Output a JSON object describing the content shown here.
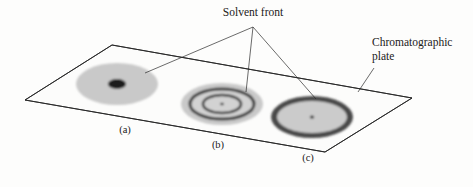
{
  "figure": {
    "background_color": "#fdfdfc"
  },
  "callouts": {
    "solvent_front": {
      "label": "Solvent front",
      "x": 253,
      "y": 18,
      "anchor_x": 253,
      "anchor_y": 27,
      "leader_targets": [
        {
          "name": "spot-a",
          "x": 145,
          "y": 73
        },
        {
          "name": "spot-b",
          "x": 246,
          "y": 92
        },
        {
          "name": "spot-c",
          "x": 316,
          "y": 99
        }
      ]
    },
    "chromatographic_plate": {
      "label_line1": "Chromatographic",
      "label_line2": "plate",
      "x": 372,
      "y": 48,
      "leader_from_x": 374,
      "leader_from_y": 68,
      "leader_to_x": 358,
      "leader_to_y": 92
    }
  },
  "plate": {
    "name": "chromatographic-plate",
    "corners": [
      {
        "x": 112,
        "y": 45
      },
      {
        "x": 412,
        "y": 98
      },
      {
        "x": 325,
        "y": 152
      },
      {
        "x": 25,
        "y": 100
      }
    ],
    "outline_color": "#262626",
    "fill_color": "#fcfcfb"
  },
  "spots": [
    {
      "id": "a",
      "caption": "(a)",
      "caption_x": 125,
      "caption_y": 133,
      "cx": 117,
      "cy": 84,
      "rx": 41,
      "ry": 21,
      "halo_color": "#c9c9c9",
      "rings": [
        {
          "type": "fill",
          "rx": 41,
          "ry": 21,
          "color": "#c9c9c9"
        },
        {
          "type": "fill",
          "rx": 9,
          "ry": 5,
          "color": "#1d1d1d"
        }
      ]
    },
    {
      "id": "b",
      "caption": "(b)",
      "caption_x": 218,
      "caption_y": 148,
      "cx": 222,
      "cy": 104,
      "rx": 41,
      "ry": 21,
      "halo_color": "#c9c9c9",
      "rings": [
        {
          "type": "fill",
          "rx": 41,
          "ry": 21,
          "color": "#c9c9c9"
        },
        {
          "type": "stroke",
          "rx": 35,
          "ry": 17,
          "color": "#3a3a3a",
          "width": 2.6
        },
        {
          "type": "fill",
          "rx": 32,
          "ry": 15,
          "color": "#d2d2d2"
        },
        {
          "type": "stroke",
          "rx": 22,
          "ry": 10.5,
          "color": "#3a3a3a",
          "width": 2.4
        },
        {
          "type": "fill",
          "rx": 19,
          "ry": 9,
          "color": "#d2d2d2"
        },
        {
          "type": "fill",
          "rx": 1.8,
          "ry": 1.3,
          "color": "#2a2a2a"
        }
      ]
    },
    {
      "id": "c",
      "caption": "(c)",
      "caption_x": 308,
      "caption_y": 161,
      "cx": 312,
      "cy": 117,
      "rx": 41,
      "ry": 21,
      "halo_color": "#cfcfcf",
      "rings": [
        {
          "type": "fill",
          "rx": 41,
          "ry": 21,
          "color": "#4a4a4a"
        },
        {
          "type": "fill",
          "rx": 35,
          "ry": 16,
          "color": "#cbcbcb"
        },
        {
          "type": "fill",
          "rx": 2.2,
          "ry": 1.6,
          "color": "#2a2a2a"
        }
      ]
    }
  ]
}
